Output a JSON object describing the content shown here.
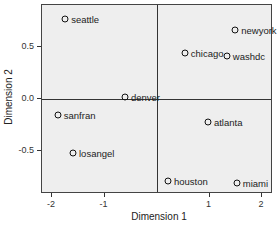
{
  "chart_data": {
    "type": "scatter",
    "title": "",
    "xlabel": "Dimension 1",
    "ylabel": "Dimension 2",
    "xlim": [
      -2.2,
      2.2
    ],
    "ylim": [
      -0.91,
      0.91
    ],
    "x_ticks": [
      "-2",
      "-1",
      "0",
      "1",
      "2"
    ],
    "y_ticks": [
      "0.5",
      "0.0",
      "-0.5"
    ],
    "reference_lines": {
      "x": 0,
      "y": 0
    },
    "grid": false,
    "legend": null,
    "points": [
      {
        "label": "seattle",
        "x": -1.75,
        "y": 0.77
      },
      {
        "label": "newyork",
        "x": 1.49,
        "y": 0.66
      },
      {
        "label": "chicago",
        "x": 0.53,
        "y": 0.44
      },
      {
        "label": "washdc",
        "x": 1.33,
        "y": 0.41
      },
      {
        "label": "denver",
        "x": -0.61,
        "y": 0.02
      },
      {
        "label": "sanfran",
        "x": -1.89,
        "y": -0.15
      },
      {
        "label": "atlanta",
        "x": 0.97,
        "y": -0.22
      },
      {
        "label": "losangel",
        "x": -1.6,
        "y": -0.52
      },
      {
        "label": "houston",
        "x": 0.21,
        "y": -0.79
      },
      {
        "label": "miami",
        "x": 1.52,
        "y": -0.81
      }
    ]
  }
}
